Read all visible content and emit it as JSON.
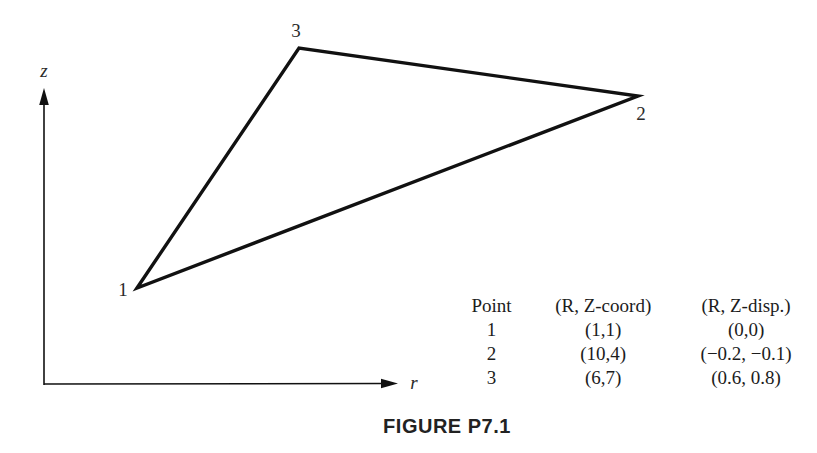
{
  "figure": {
    "caption": "FIGURE P7.1",
    "axes": {
      "x_label": "r",
      "y_label": "z"
    },
    "triangle": {
      "vertices": [
        {
          "label": "1",
          "coord": "(1,1)",
          "disp": "(0,0)"
        },
        {
          "label": "2",
          "coord": "(10,4)",
          "disp": "(−0.2, −0.1)"
        },
        {
          "label": "3",
          "coord": "(6,7)",
          "disp": "(0.6, 0.8)"
        }
      ]
    },
    "table": {
      "headers": [
        "Point",
        "(R, Z-coord)",
        "(R, Z-disp.)"
      ],
      "rows": [
        [
          "1",
          "(1,1)",
          "(0,0)"
        ],
        [
          "2",
          "(10,4)",
          "(−0.2, −0.1)"
        ],
        [
          "3",
          "(6,7)",
          "(0.6, 0.8)"
        ]
      ]
    },
    "colors": {
      "line": "#111111",
      "text": "#1c1c1c"
    }
  }
}
